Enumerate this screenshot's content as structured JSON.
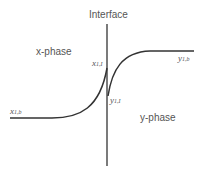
{
  "diagram": {
    "title": "Interface",
    "left_phase": "x-phase",
    "right_phase": "y-phase",
    "labels": {
      "x_bulk": {
        "base": "x",
        "sub": "1,b"
      },
      "x_interface": {
        "base": "x",
        "sub": "1,I"
      },
      "y_interface": {
        "base": "y",
        "sub": "1,I"
      },
      "y_bulk": {
        "base": "y",
        "sub": "1,b"
      }
    },
    "line_color": "#333333",
    "text_color": "#555555"
  }
}
